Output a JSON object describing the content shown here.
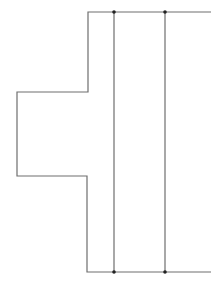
{
  "diagram": {
    "stroke_color": "#6e6e6e",
    "dot_color": "#222222",
    "outline_points": "211,12 88,12 88,92 17,92 17,176 87,176 87,272 211,272",
    "vertical_lines": [
      {
        "x": 114,
        "y1": 12,
        "y2": 272
      },
      {
        "x": 165,
        "y1": 12,
        "y2": 272
      }
    ],
    "junction_dots": [
      {
        "x": 114,
        "y": 12
      },
      {
        "x": 165,
        "y": 12
      },
      {
        "x": 114,
        "y": 272
      },
      {
        "x": 165,
        "y": 272
      }
    ]
  }
}
